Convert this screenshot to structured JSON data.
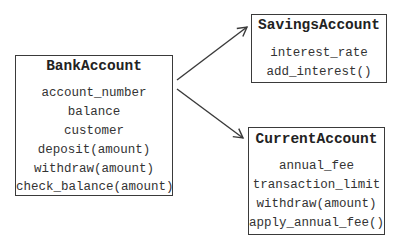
{
  "diagram": {
    "classes": [
      {
        "name": "BankAccount",
        "members": [
          "account_number",
          "balance",
          "customer",
          "deposit(amount)",
          "withdraw(amount)",
          "check_balance(amount)"
        ]
      },
      {
        "name": "SavingsAccount",
        "members": [
          "interest_rate",
          "add_interest()"
        ]
      },
      {
        "name": "CurrentAccount",
        "members": [
          "annual_fee",
          "transaction_limit",
          "withdraw(amount)",
          "apply_annual_fee()"
        ]
      }
    ],
    "relations": [
      {
        "from": "BankAccount",
        "to": "SavingsAccount",
        "type": "arrow"
      },
      {
        "from": "BankAccount",
        "to": "CurrentAccount",
        "type": "arrow"
      }
    ],
    "colors": {
      "line": "#3a3a3a",
      "text": "#2a2a2a",
      "background": "#ffffff"
    }
  }
}
